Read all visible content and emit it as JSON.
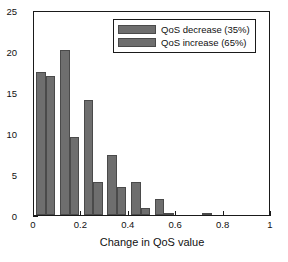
{
  "chart_data": {
    "type": "bar",
    "title": "",
    "xlabel": "Change in QoS value",
    "ylabel": "Percent (%)",
    "xlim": [
      0,
      1
    ],
    "ylim": [
      0,
      25
    ],
    "xticks": [
      "0",
      "0.2",
      "0.4",
      "0.6",
      "0.8",
      "1"
    ],
    "xtick_values": [
      0,
      0.2,
      0.4,
      0.6,
      0.8,
      1
    ],
    "yticks": [
      "0",
      "5",
      "10",
      "15",
      "20",
      "25"
    ],
    "ytick_values": [
      0,
      5,
      10,
      15,
      20,
      25
    ],
    "grid": false,
    "legend_position": "top-right",
    "bin_centers": [
      0.05,
      0.15,
      0.25,
      0.35,
      0.45,
      0.55,
      0.65,
      0.75
    ],
    "categories": [
      "0.05",
      "0.15",
      "0.25",
      "0.35",
      "0.45",
      "0.55",
      "0.65",
      "0.75"
    ],
    "series": [
      {
        "name": "QoS decrease (35%)",
        "color": "#6e6e6e",
        "values": [
          17.5,
          20.1,
          14.0,
          7.3,
          4.0,
          2.0,
          0.0,
          0.3
        ]
      },
      {
        "name": "QoS increase (65%)",
        "color": "#6e6e6e",
        "values": [
          17.0,
          9.5,
          4.0,
          3.4,
          0.9,
          0.3,
          0.0,
          0.0
        ]
      }
    ]
  },
  "legend": {
    "entries": [
      {
        "label": "QoS decrease (35%)"
      },
      {
        "label": "QoS increase (65%)"
      }
    ]
  },
  "axes": {
    "x_title": "Change in QoS value",
    "y_title": "Percent (%)"
  },
  "colors": {
    "bar_fill": "#6e6e6e",
    "bar_edge": "#4a4a4a",
    "axis": "#1a1a1a",
    "text": "#111111",
    "background": "#ffffff"
  }
}
